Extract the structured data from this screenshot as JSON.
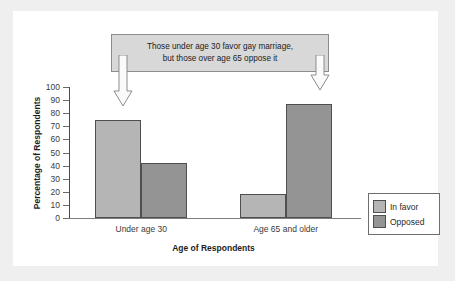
{
  "chart_data": {
    "type": "bar",
    "title": "",
    "xlabel": "Age of Respondents",
    "ylabel": "Percentage of Respondents",
    "categories": [
      "Under age 30",
      "Age 65 and older"
    ],
    "series": [
      {
        "name": "In favor",
        "values": [
          75,
          18
        ],
        "color": "#b5b5b5"
      },
      {
        "name": "Opposed",
        "values": [
          42,
          87
        ],
        "color": "#949494"
      }
    ],
    "ylim": [
      0,
      100
    ],
    "yticks": [
      0,
      10,
      20,
      30,
      40,
      50,
      60,
      70,
      80,
      90,
      100
    ],
    "ytick_labels": [
      "0",
      "10",
      "20",
      "30",
      "40",
      "50",
      "60",
      "70",
      "80",
      "90",
      "100"
    ],
    "grid": false,
    "legend_position": "right",
    "annotations": [
      {
        "text_line1": "Those under age 30 favor gay marriage,",
        "text_line2": "but those over age 65 oppose it",
        "points_to": [
          "Under age 30 / In favor",
          "Age 65 and older / Opposed"
        ]
      }
    ]
  },
  "callout": {
    "line1": "Those under age 30 favor gay marriage,",
    "line2": "but those over age 65 oppose it"
  },
  "legend": {
    "items": [
      {
        "label": "In favor"
      },
      {
        "label": "Opposed"
      }
    ]
  },
  "axes": {
    "y_title": "Percentage of Respondents",
    "x_title": "Age of Respondents"
  }
}
